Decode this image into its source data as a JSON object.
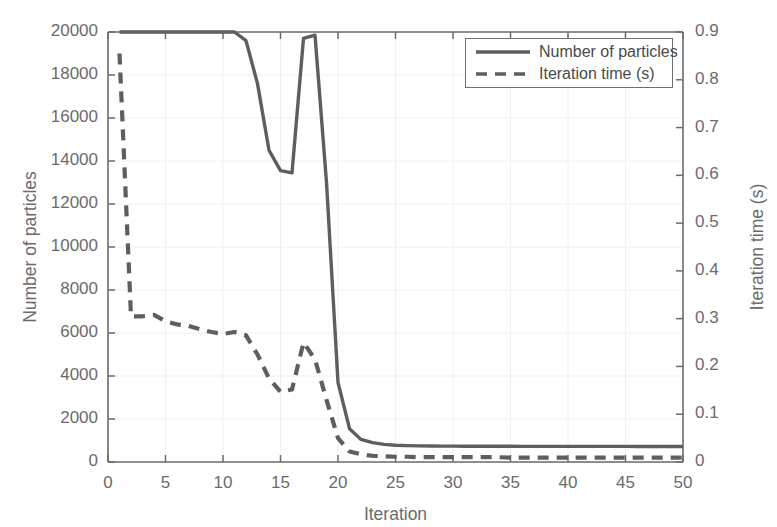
{
  "chart_data": {
    "type": "line",
    "title": "",
    "xlabel": "Iteration",
    "ylabel": "Number of particles",
    "y2label": "Iteration time (s)",
    "xlim": [
      0,
      50
    ],
    "ylim": [
      0,
      20000
    ],
    "y2lim": [
      0,
      0.9
    ],
    "xticks": [
      "0",
      "5",
      "10",
      "15",
      "20",
      "25",
      "30",
      "35",
      "40",
      "45",
      "50"
    ],
    "xtick_values": [
      0,
      5,
      10,
      15,
      20,
      25,
      30,
      35,
      40,
      45,
      50
    ],
    "yticks": [
      "0",
      "2000",
      "4000",
      "6000",
      "8000",
      "10000",
      "12000",
      "14000",
      "16000",
      "18000",
      "20000"
    ],
    "ytick_values": [
      0,
      2000,
      4000,
      6000,
      8000,
      10000,
      12000,
      14000,
      16000,
      18000,
      20000
    ],
    "y2ticks": [
      "0",
      "0.1",
      "0.2",
      "0.3",
      "0.4",
      "0.5",
      "0.6",
      "0.7",
      "0.8",
      "0.9"
    ],
    "y2tick_values": [
      0,
      0.1,
      0.2,
      0.3,
      0.4,
      0.5,
      0.6,
      0.7,
      0.8,
      0.9
    ],
    "grid": true,
    "legend_position": "top-right",
    "legend": [
      "Number of particles",
      "Iteration time (s)"
    ],
    "line_color": "#5e5e5e",
    "axis_color": "#6b6b6b",
    "grid_color": "#f0f0f0",
    "background": "#ffffff",
    "series": [
      {
        "name": "Number of particles",
        "axis": "left",
        "style": "solid",
        "color": "#5e5e5e",
        "x": [
          1,
          2,
          3,
          4,
          5,
          6,
          7,
          8,
          9,
          10,
          11,
          12,
          13,
          14,
          15,
          16,
          17,
          18,
          19,
          20,
          21,
          22,
          23,
          24,
          25,
          26,
          27,
          28,
          29,
          30,
          31,
          32,
          33,
          34,
          35,
          36,
          37,
          38,
          39,
          40,
          41,
          42,
          43,
          44,
          45,
          46,
          47,
          48,
          49,
          50
        ],
        "values": [
          20000,
          20000,
          20000,
          20000,
          20000,
          20000,
          20000,
          20000,
          20000,
          20000,
          20000,
          19600,
          17600,
          14500,
          13550,
          13450,
          19700,
          19850,
          13000,
          3700,
          1550,
          1050,
          900,
          820,
          780,
          760,
          750,
          745,
          740,
          738,
          735,
          733,
          732,
          730,
          730,
          729,
          728,
          728,
          727,
          727,
          726,
          726,
          725,
          725,
          725,
          724,
          724,
          724,
          723,
          723
        ]
      },
      {
        "name": "Iteration time (s)",
        "axis": "right",
        "style": "dashed",
        "color": "#5e5e5e",
        "x": [
          1,
          2,
          3,
          4,
          5,
          6,
          7,
          8,
          9,
          10,
          11,
          12,
          13,
          14,
          15,
          16,
          17,
          18,
          19,
          20,
          21,
          22,
          23,
          24,
          25,
          26,
          27,
          28,
          29,
          30,
          31,
          32,
          33,
          34,
          35,
          36,
          37,
          38,
          39,
          40,
          41,
          42,
          43,
          44,
          45,
          46,
          47,
          48,
          49,
          50
        ],
        "values": [
          0.855,
          0.305,
          0.305,
          0.308,
          0.295,
          0.288,
          0.285,
          0.278,
          0.272,
          0.268,
          0.272,
          0.265,
          0.225,
          0.175,
          0.147,
          0.152,
          0.25,
          0.215,
          0.13,
          0.05,
          0.022,
          0.016,
          0.013,
          0.012,
          0.011,
          0.011,
          0.01,
          0.01,
          0.01,
          0.01,
          0.01,
          0.01,
          0.01,
          0.01,
          0.009,
          0.009,
          0.009,
          0.009,
          0.009,
          0.009,
          0.009,
          0.009,
          0.009,
          0.009,
          0.009,
          0.009,
          0.009,
          0.009,
          0.009,
          0.009
        ]
      }
    ]
  }
}
